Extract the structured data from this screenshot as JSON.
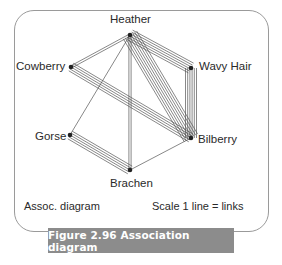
{
  "figure": {
    "caption": "Figure 2.96  Association diagram",
    "footer_left": "Assoc. diagram",
    "footer_right": "Scale 1 line = links"
  },
  "nodes": [
    {
      "id": "heather",
      "label": "Heather",
      "x": 130,
      "y": 35
    },
    {
      "id": "cowberry",
      "label": "Cowberry",
      "x": 71,
      "y": 67
    },
    {
      "id": "wavy_hair",
      "label": "Wavy Hair",
      "x": 191,
      "y": 68
    },
    {
      "id": "gorse",
      "label": "Gorse",
      "x": 70,
      "y": 135
    },
    {
      "id": "bilberry",
      "label": "Bilberry",
      "x": 191,
      "y": 138
    },
    {
      "id": "brachen",
      "label": "Brachen",
      "x": 130,
      "y": 170
    }
  ],
  "links": [
    {
      "from": "heather",
      "to": "cowberry",
      "count": 2
    },
    {
      "from": "heather",
      "to": "wavy_hair",
      "count": 6
    },
    {
      "from": "heather",
      "to": "bilberry",
      "count": 8
    },
    {
      "from": "heather",
      "to": "brachen",
      "count": 2
    },
    {
      "from": "heather",
      "to": "gorse",
      "count": 1
    },
    {
      "from": "cowberry",
      "to": "bilberry",
      "count": 5
    },
    {
      "from": "wavy_hair",
      "to": "bilberry",
      "count": 6
    },
    {
      "from": "gorse",
      "to": "brachen",
      "count": 5
    },
    {
      "from": "brachen",
      "to": "bilberry",
      "count": 1
    }
  ],
  "style": {
    "line_color": "#555555",
    "node_color": "#222222",
    "line_spacing": 2.2
  }
}
